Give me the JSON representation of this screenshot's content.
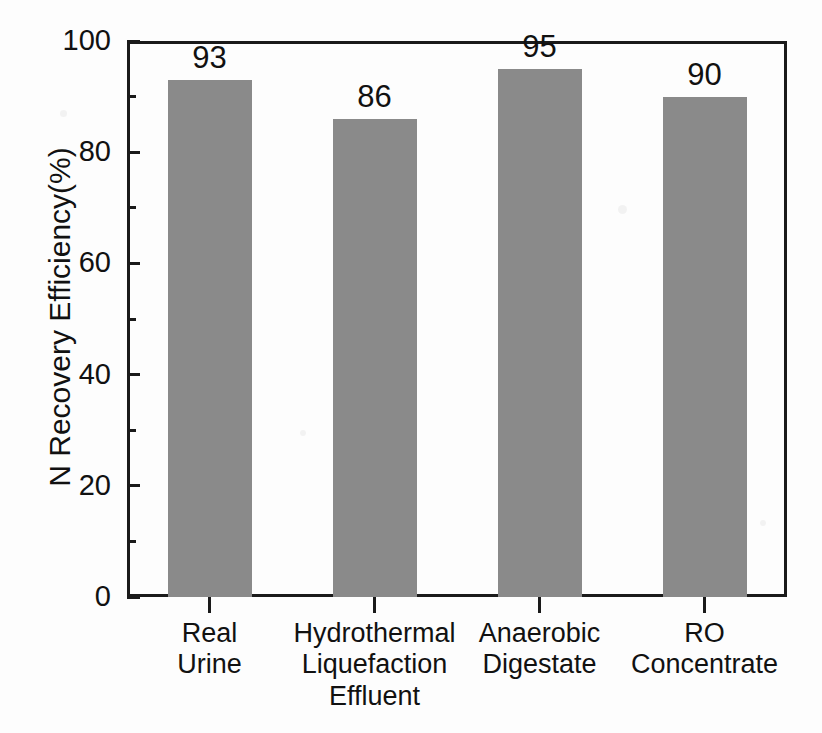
{
  "chart_data": {
    "type": "bar",
    "title": "",
    "xlabel": "",
    "ylabel": "N Recovery Efficiency(%)",
    "categories": [
      "Real\nUrine",
      "Hydrothermal\nLiquefaction\nEffluent",
      "Anaerobic\nDigestate",
      "RO\nConcentrate"
    ],
    "category_lines": [
      [
        "Real",
        "Urine"
      ],
      [
        "Hydrothermal",
        "Liquefaction",
        "Effluent"
      ],
      [
        "Anaerobic",
        "Digestate"
      ],
      [
        "RO",
        "Concentrate"
      ]
    ],
    "values": [
      93,
      86,
      95,
      90
    ],
    "value_labels": [
      "93",
      "86",
      "95",
      "90"
    ],
    "ylim": [
      0,
      100
    ],
    "y_major_ticks": [
      0,
      20,
      40,
      60,
      80,
      100
    ],
    "y_tick_labels": [
      "0",
      "20",
      "40",
      "60",
      "80",
      "100"
    ],
    "y_minor_ticks": [
      10,
      30,
      50,
      70,
      90
    ],
    "grid": false,
    "legend": "none",
    "bar_color": "#8a8a8a",
    "axis_color": "#1a1a1a",
    "background_color": "#fdfdfd",
    "text_color": "#111111"
  }
}
